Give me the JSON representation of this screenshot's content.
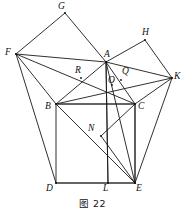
{
  "figure": {
    "caption": "图 22",
    "type": "euclidean-geometry-diagram",
    "line_color": "#1a1a1a",
    "background_color": "#ffffff",
    "points": [
      {
        "id": "G",
        "label": "G",
        "x": 65,
        "y": 13,
        "label_x": 58,
        "label_y": 2
      },
      {
        "id": "H",
        "label": "H",
        "x": 145,
        "y": 40,
        "label_x": 142,
        "label_y": 28
      },
      {
        "id": "F",
        "label": "F",
        "x": 16,
        "y": 54,
        "label_x": 5,
        "label_y": 48
      },
      {
        "id": "A",
        "label": "A",
        "x": 106,
        "y": 62,
        "label_x": 104,
        "label_y": 50
      },
      {
        "id": "K",
        "label": "K",
        "x": 172,
        "y": 78,
        "label_x": 174,
        "label_y": 72
      },
      {
        "id": "R",
        "label": "R",
        "x": 81,
        "y": 78,
        "label_x": 75,
        "label_y": 66
      },
      {
        "id": "Q",
        "label": "Q",
        "x": 121,
        "y": 80,
        "label_x": 122,
        "label_y": 67
      },
      {
        "id": "O",
        "label": "O",
        "x": 112,
        "y": 85,
        "label_x": 108,
        "label_y": 76
      },
      {
        "id": "B",
        "label": "B",
        "x": 56,
        "y": 104,
        "label_x": 45,
        "label_y": 102
      },
      {
        "id": "C",
        "label": "C",
        "x": 135,
        "y": 104,
        "label_x": 138,
        "label_y": 102
      },
      {
        "id": "N",
        "label": "N",
        "x": 101,
        "y": 136,
        "label_x": 88,
        "label_y": 124
      },
      {
        "id": "D",
        "label": "D",
        "x": 56,
        "y": 183,
        "label_x": 46,
        "label_y": 184
      },
      {
        "id": "L",
        "label": "L",
        "x": 108,
        "y": 183,
        "label_x": 103,
        "label_y": 184
      },
      {
        "id": "E",
        "label": "E",
        "x": 135,
        "y": 183,
        "label_x": 136,
        "label_y": 184
      }
    ],
    "segments": [
      {
        "name": "square-BDEC-left",
        "from": "B",
        "to": "D",
        "weight": "normal"
      },
      {
        "name": "square-BDEC-bottom",
        "from": "D",
        "to": "E",
        "weight": "thick"
      },
      {
        "name": "square-BDEC-right",
        "from": "E",
        "to": "C",
        "weight": "normal"
      },
      {
        "name": "square-BDEC-top",
        "from": "C",
        "to": "B",
        "weight": "thick"
      },
      {
        "name": "square-ABFG-side-BF",
        "from": "B",
        "to": "F",
        "weight": "normal"
      },
      {
        "name": "square-ABFG-side-FG",
        "from": "F",
        "to": "G",
        "weight": "normal"
      },
      {
        "name": "square-ABFG-side-GA",
        "from": "G",
        "to": "A",
        "weight": "normal"
      },
      {
        "name": "square-ACKH-side-AH",
        "from": "A",
        "to": "H",
        "weight": "normal"
      },
      {
        "name": "square-ACKH-side-HK",
        "from": "H",
        "to": "K",
        "weight": "normal"
      },
      {
        "name": "square-ACKH-side-KC",
        "from": "K",
        "to": "C",
        "weight": "normal"
      },
      {
        "name": "side-AB",
        "from": "A",
        "to": "B",
        "weight": "normal"
      },
      {
        "name": "side-AC",
        "from": "A",
        "to": "C",
        "weight": "normal"
      },
      {
        "name": "cevian-FA",
        "from": "F",
        "to": "A",
        "weight": "normal"
      },
      {
        "name": "cevian-FC",
        "from": "F",
        "to": "C",
        "weight": "normal"
      },
      {
        "name": "cevian-FD",
        "from": "F",
        "to": "D",
        "weight": "normal"
      },
      {
        "name": "cevian-KA",
        "from": "K",
        "to": "A",
        "weight": "normal"
      },
      {
        "name": "cevian-KB",
        "from": "K",
        "to": "B",
        "weight": "normal"
      },
      {
        "name": "cevian-KE",
        "from": "K",
        "to": "E",
        "weight": "normal"
      },
      {
        "name": "cevian-AE",
        "from": "A",
        "to": "E",
        "weight": "normal"
      },
      {
        "name": "cevian-AL",
        "from": "A",
        "to": "L",
        "weight": "normal"
      },
      {
        "name": "cevian-BE",
        "from": "B",
        "to": "E",
        "weight": "normal"
      },
      {
        "name": "cevian-CE-alt",
        "from": "C",
        "to": "E",
        "weight": "normal"
      },
      {
        "name": "cevian-CN",
        "from": "C",
        "to": "N",
        "weight": "normal"
      },
      {
        "name": "cevian-NE",
        "from": "N",
        "to": "E",
        "weight": "normal"
      },
      {
        "name": "altitude-AL",
        "from": "A",
        "to": "L",
        "weight": "normal"
      }
    ]
  }
}
